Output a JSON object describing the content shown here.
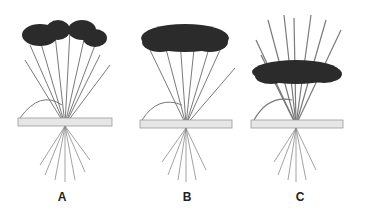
{
  "figure": {
    "plants": [
      {
        "id": "A",
        "label": "A",
        "panicle_position": "top, drooping",
        "left": 0,
        "label_x": 52
      },
      {
        "id": "B",
        "label": "B",
        "panicle_position": "top, dense crown",
        "left": 120,
        "label_x": 57
      },
      {
        "id": "C",
        "label": "C",
        "panicle_position": "middle, below leaves",
        "left": 236,
        "label_x": 54
      }
    ],
    "colors": {
      "panicle": "#2a2a2a",
      "stem": "#6a6a6a",
      "ground": "#9a9a9a",
      "root": "#8a8a8a"
    }
  }
}
